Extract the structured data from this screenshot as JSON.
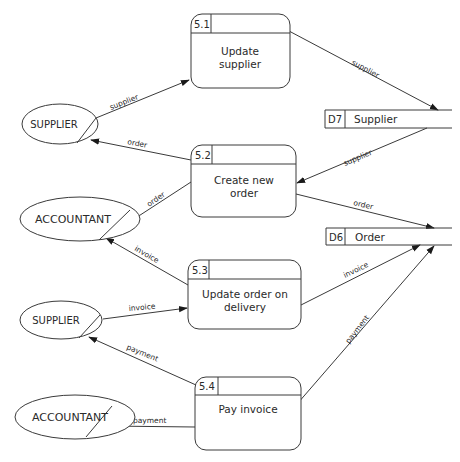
{
  "diagram": {
    "type": "data-flow-diagram",
    "processes": [
      {
        "id": "5.1",
        "name_line1": "Update",
        "name_line2": "supplier"
      },
      {
        "id": "5.2",
        "name_line1": "Create new",
        "name_line2": "order"
      },
      {
        "id": "5.3",
        "name_line1": "Update order on",
        "name_line2": "delivery"
      },
      {
        "id": "5.4",
        "name_line1": "Pay invoice",
        "name_line2": ""
      }
    ],
    "data_stores": [
      {
        "id": "D7",
        "name": "Supplier"
      },
      {
        "id": "D6",
        "name": "Order"
      }
    ],
    "external_entities": [
      {
        "name": "SUPPLIER"
      },
      {
        "name": "ACCOUNTANT"
      },
      {
        "name": "SUPPLIER"
      },
      {
        "name": "ACCOUNTANT"
      }
    ],
    "flows": [
      {
        "label": "supplier",
        "from": "SUPPLIER",
        "to": "5.1"
      },
      {
        "label": "supplier",
        "from": "5.1",
        "to": "D7"
      },
      {
        "label": "order",
        "from": "5.2",
        "to": "SUPPLIER"
      },
      {
        "label": "supplier",
        "from": "D7",
        "to": "5.2"
      },
      {
        "label": "order",
        "from": "5.2",
        "to": "ACCOUNTANT"
      },
      {
        "label": "order",
        "from": "5.2",
        "to": "D6"
      },
      {
        "label": "invoice",
        "from": "5.3",
        "to": "ACCOUNTANT"
      },
      {
        "label": "invoice",
        "from": "SUPPLIER",
        "to": "5.3"
      },
      {
        "label": "invoice",
        "from": "5.3",
        "to": "D6"
      },
      {
        "label": "payment",
        "from": "5.4",
        "to": "SUPPLIER"
      },
      {
        "label": "payment",
        "from": "5.4",
        "to": "D6"
      },
      {
        "label": "payment",
        "from": "5.4",
        "to": "ACCOUNTANT"
      }
    ]
  }
}
